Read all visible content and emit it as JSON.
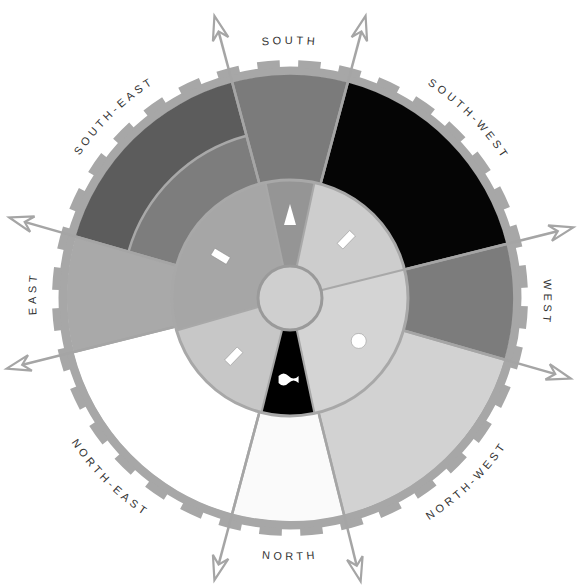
{
  "center": {
    "x": 290,
    "y": 298
  },
  "radii": {
    "hub": 32,
    "inner": 118,
    "se_mid": 168,
    "outer": 223,
    "rim_inner": 223,
    "rim_outer": 231,
    "tooth_outer": 238,
    "arrow_tip": 292
  },
  "colors": {
    "rim": "#a7a7a7",
    "divider": "#a8a8a8",
    "hub": "#cfcfcf",
    "hub_stroke": "#9a9a9a",
    "arrow": "#a5a5a5",
    "symbol": "#ffffff"
  },
  "outer_sectors": [
    {
      "name": "south",
      "start": -15,
      "end": 15,
      "color": "#7b7b7b"
    },
    {
      "name": "south-west",
      "start": 15,
      "end": 76,
      "color": "#050505"
    },
    {
      "name": "west",
      "start": 76,
      "end": 106,
      "color": "#7c7c7c"
    },
    {
      "name": "north-west",
      "start": 106,
      "end": 166,
      "color": "#d2d2d2"
    },
    {
      "name": "north",
      "start": 166,
      "end": 195,
      "color": "#fafafa"
    },
    {
      "name": "north-east",
      "start": 195,
      "end": 256,
      "color": "#ffffff"
    },
    {
      "name": "east",
      "start": 256,
      "end": 286,
      "color": "#a9a9a9"
    },
    {
      "name": "south-east",
      "start": 286,
      "end": 345,
      "color": "#5c5c5c"
    }
  ],
  "se_inner_band": {
    "start": 286,
    "end": 345,
    "color": "#7d7d7d"
  },
  "inner_sectors": [
    {
      "name": "inner-south",
      "start": -12,
      "end": 12,
      "color": "#959595",
      "symbol": "triangle"
    },
    {
      "name": "inner-south-west",
      "start": 12,
      "end": 76,
      "color": "#cdcdcd",
      "symbol": "bar"
    },
    {
      "name": "inner-north-west",
      "start": 76,
      "end": 168,
      "color": "#d4d4d4",
      "symbol": "circle"
    },
    {
      "name": "inner-north",
      "start": 168,
      "end": 194,
      "color": "#000000",
      "symbol": "wave"
    },
    {
      "name": "inner-north-east",
      "start": 194,
      "end": 254,
      "color": "#c7c7c7",
      "symbol": "bar"
    },
    {
      "name": "inner-east-south-east",
      "start": 254,
      "end": 348,
      "color": "#a6a6a6",
      "symbol": "bar"
    }
  ],
  "arrows": [
    -15,
    15,
    76,
    106,
    166,
    195,
    256,
    286
  ],
  "teeth_count": 36,
  "labels": [
    {
      "text": "SOUTH",
      "angle": 0
    },
    {
      "text": "SOUTH-WEST",
      "angle": 45
    },
    {
      "text": "WEST",
      "angle": 91
    },
    {
      "text": "NORTH-WEST",
      "angle": 136
    },
    {
      "text": "NORTH",
      "angle": 180
    },
    {
      "text": "NORTH-EAST",
      "angle": 225
    },
    {
      "text": "EAST",
      "angle": 271
    },
    {
      "text": "SOUTH-EAST",
      "angle": 316
    }
  ]
}
